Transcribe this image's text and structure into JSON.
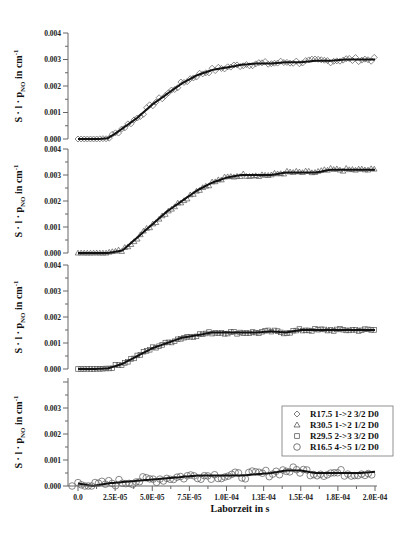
{
  "chart_data": {
    "type": "scatter",
    "layout": "4 vertically stacked panels sharing x-axis",
    "xlabel": "Laborzeit  in  s",
    "ylabel": "S · l · p_NO  in  cm^-1",
    "ylabel_parts": {
      "prefix": "S · l · p",
      "sub": "NO",
      "mid": "  in  cm",
      "sup": "-1"
    },
    "xlim": [
      -5e-06,
      0.0002
    ],
    "x_ticks": [
      0.0,
      2.5e-05,
      5e-05,
      7.5e-05,
      0.0001,
      0.000125,
      0.00015,
      0.000175,
      0.0002
    ],
    "x_tick_labels": [
      "0.0",
      "2.5E-05",
      "5.0E-05",
      "7.5E-05",
      "1.0E-04",
      "1.3E-04",
      "1.5E-04",
      "1.8E-04",
      "2.0E-04"
    ],
    "y_ticks": [
      0.0,
      0.001,
      0.002,
      0.003,
      0.004
    ],
    "y_tick_labels": [
      "0.000",
      "0.001",
      "0.002",
      "0.003",
      "0.004"
    ],
    "grid": false,
    "legend": {
      "position": "lower-right panel, upper right",
      "entries": [
        {
          "marker": "diamond",
          "symbol": "◇",
          "label": "R17.5 1->2 3/2 D0"
        },
        {
          "marker": "triangle",
          "symbol": "△",
          "label": "R30.5 1->2 1/2 D0"
        },
        {
          "marker": "square",
          "symbol": "□",
          "label": "R29.5 2->3 3/2 D0"
        },
        {
          "marker": "circle",
          "symbol": "○",
          "label": "R16.5 4->5 1/2 D0"
        }
      ]
    },
    "panels": [
      {
        "name": "R17.5 1->2 3/2 D0",
        "marker": "diamond",
        "ylim": [
          0,
          0.004
        ],
        "fit_x": [
          0.0,
          1.5e-05,
          2e-05,
          2.5e-05,
          3e-05,
          4e-05,
          5e-05,
          6e-05,
          7e-05,
          8e-05,
          9e-05,
          0.0001,
          0.00011,
          0.00012,
          0.00013,
          0.00014,
          0.00015,
          0.00016,
          0.00017,
          0.00018,
          0.00019,
          0.0002
        ],
        "fit_y": [
          0.0,
          0.0,
          3e-05,
          0.0002,
          0.0004,
          0.0008,
          0.0013,
          0.0017,
          0.0021,
          0.0024,
          0.0026,
          0.0027,
          0.0028,
          0.00285,
          0.00285,
          0.0029,
          0.0029,
          0.00295,
          0.00295,
          0.003,
          0.003,
          0.003
        ]
      },
      {
        "name": "R30.5 1->2 1/2 D0",
        "marker": "triangle",
        "ylim": [
          0,
          0.004
        ],
        "fit_x": [
          0.0,
          2e-05,
          3e-05,
          4e-05,
          5e-05,
          6e-05,
          7e-05,
          8e-05,
          9e-05,
          0.0001,
          0.00011,
          0.00012,
          0.00013,
          0.00014,
          0.00015,
          0.00016,
          0.00017,
          0.00018,
          0.00019,
          0.0002
        ],
        "fit_y": [
          0.0,
          0.0,
          0.0001,
          0.0006,
          0.0011,
          0.0016,
          0.002,
          0.0024,
          0.0027,
          0.0029,
          0.003,
          0.003,
          0.003,
          0.0031,
          0.0031,
          0.0031,
          0.0032,
          0.0032,
          0.0032,
          0.0032
        ]
      },
      {
        "name": "R29.5 2->3 3/2 D0",
        "marker": "square",
        "ylim": [
          0,
          0.004
        ],
        "fit_x": [
          0.0,
          1e-05,
          2e-05,
          3e-05,
          4e-05,
          5e-05,
          6e-05,
          7e-05,
          8e-05,
          9e-05,
          0.0001,
          0.00011,
          0.00012,
          0.00013,
          0.00014,
          0.00015,
          0.00016,
          0.00017,
          0.00018,
          0.00019,
          0.0002
        ],
        "fit_y": [
          0.0,
          0.0,
          2e-05,
          0.0002,
          0.0005,
          0.0008,
          0.001,
          0.0012,
          0.0013,
          0.0014,
          0.0014,
          0.0014,
          0.0014,
          0.00145,
          0.0014,
          0.0015,
          0.0015,
          0.0015,
          0.0015,
          0.0015,
          0.0015
        ]
      },
      {
        "name": "R16.5 4->5 1/2 D0",
        "marker": "circle",
        "ylim": [
          0,
          0.0035
        ],
        "fit_x": [
          0.0,
          1e-05,
          2e-05,
          3e-05,
          4e-05,
          5e-05,
          6e-05,
          7e-05,
          8e-05,
          9e-05,
          0.0001,
          0.00011,
          0.00012,
          0.00013,
          0.00014,
          0.00015,
          0.00016,
          0.00017,
          0.00018,
          0.00019,
          0.0002
        ],
        "fit_y": [
          0.0001,
          0.0,
          0.0001,
          0.00015,
          0.0002,
          0.00025,
          0.0003,
          0.00035,
          0.0004,
          0.0004,
          0.0004,
          0.0004,
          0.00045,
          0.0005,
          0.0006,
          0.0006,
          0.0005,
          0.0005,
          0.0005,
          0.0005,
          0.00055
        ]
      }
    ]
  }
}
